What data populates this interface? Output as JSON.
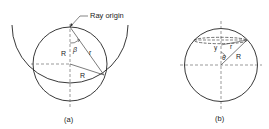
{
  "figure": {
    "panels": [
      {
        "id": "a",
        "caption": "(a)",
        "labels": {
          "ray_origin": "Ray origin",
          "vertical_radius": "R",
          "angle": "β",
          "ray": "r",
          "radius": "R"
        }
      },
      {
        "id": "b",
        "caption": "(b)",
        "labels": {
          "height": "y",
          "ray": "r",
          "angle": "θ",
          "radius": "R"
        }
      }
    ],
    "colors": {
      "line": "#222222",
      "dashed": "#555555",
      "background": "#ffffff"
    }
  }
}
